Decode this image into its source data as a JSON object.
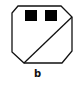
{
  "figure": {
    "label": "b",
    "stroke_color": "#111111",
    "fill_color": "#ffffff",
    "square_color": "#000000"
  }
}
